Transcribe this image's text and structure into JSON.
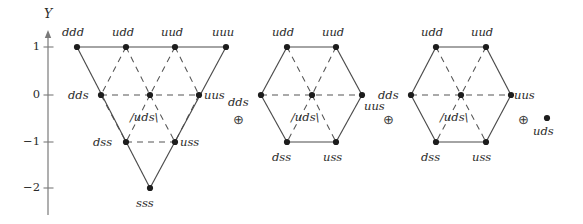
{
  "figure": {
    "axis": {
      "name": "Y",
      "ticks": [
        {
          "label": "1",
          "value": 1,
          "y": 47
        },
        {
          "label": "0",
          "value": 0,
          "y": 95
        },
        {
          "label": "−1",
          "value": -1,
          "y": 142
        },
        {
          "label": "−2",
          "value": -2,
          "y": 188
        }
      ],
      "axis_x": 48,
      "axis_top": 36,
      "axis_bottom": 215
    },
    "operators": [
      {
        "name": "oplus-1",
        "symbol": "⊕",
        "x": 233,
        "y": 113
      },
      {
        "name": "oplus-2",
        "symbol": "⊕",
        "x": 383,
        "y": 113
      },
      {
        "name": "oplus-3",
        "symbol": "⊕",
        "x": 518,
        "y": 113
      }
    ],
    "multiplets": [
      {
        "name": "decuplet",
        "shape": "triangle",
        "nodes": [
          {
            "id": "ddd",
            "label": "ddd",
            "x": 77,
            "y": 47,
            "Y": 1,
            "lx": 62,
            "ly": 27,
            "anchor": "left"
          },
          {
            "id": "udd",
            "label": "udd",
            "x": 126,
            "y": 47,
            "Y": 1,
            "lx": 112,
            "ly": 27,
            "anchor": "left"
          },
          {
            "id": "uud",
            "label": "uud",
            "x": 175,
            "y": 47,
            "Y": 1,
            "lx": 161,
            "ly": 27,
            "anchor": "left"
          },
          {
            "id": "uuu",
            "label": "uuu",
            "x": 226,
            "y": 47,
            "Y": 1,
            "lx": 212,
            "ly": 27,
            "anchor": "left"
          },
          {
            "id": "dds",
            "label": "dds",
            "x": 101,
            "y": 95,
            "Y": 0,
            "lx": 68,
            "ly": 90,
            "anchor": "left"
          },
          {
            "id": "uds",
            "label": "/uds\\",
            "x": 150,
            "y": 95,
            "Y": 0,
            "lx": 130,
            "ly": 112,
            "anchor": "left"
          },
          {
            "id": "uus",
            "label": "uus",
            "x": 199,
            "y": 95,
            "Y": 0,
            "lx": 204,
            "ly": 90,
            "anchor": "left"
          },
          {
            "id": "dss",
            "label": "dss",
            "x": 126,
            "y": 142,
            "Y": -1,
            "lx": 93,
            "ly": 137,
            "anchor": "left"
          },
          {
            "id": "uss",
            "label": "uss",
            "x": 175,
            "y": 142,
            "Y": -1,
            "lx": 180,
            "ly": 137,
            "anchor": "left"
          },
          {
            "id": "sss",
            "label": "sss",
            "x": 150,
            "y": 188,
            "Y": -2,
            "lx": 136,
            "ly": 198,
            "anchor": "left"
          }
        ],
        "solid_edges": [
          [
            77,
            47,
            226,
            47
          ],
          [
            77,
            47,
            150,
            188
          ],
          [
            226,
            47,
            150,
            188
          ]
        ],
        "dashed_edges": [
          [
            101,
            95,
            199,
            95
          ],
          [
            126,
            142,
            175,
            142
          ],
          [
            126,
            47,
            101,
            95
          ],
          [
            126,
            47,
            150,
            95
          ],
          [
            175,
            47,
            150,
            95
          ],
          [
            175,
            47,
            199,
            95
          ],
          [
            101,
            95,
            126,
            142
          ],
          [
            150,
            95,
            126,
            142
          ],
          [
            150,
            95,
            175,
            142
          ],
          [
            199,
            95,
            175,
            142
          ]
        ]
      },
      {
        "name": "octet-1",
        "shape": "hexagon",
        "nodes": [
          {
            "id": "udd",
            "label": "udd",
            "x": 287,
            "y": 47,
            "Y": 1,
            "lx": 272,
            "ly": 27,
            "anchor": "left"
          },
          {
            "id": "uud",
            "label": "uud",
            "x": 336,
            "y": 47,
            "Y": 1,
            "lx": 322,
            "ly": 27,
            "anchor": "left"
          },
          {
            "id": "dds",
            "label": "dds",
            "x": 261,
            "y": 95,
            "Y": 0,
            "lx": 228,
            "ly": 97,
            "anchor": "left"
          },
          {
            "id": "uds",
            "label": "/uds\\",
            "x": 312,
            "y": 95,
            "Y": 0,
            "lx": 291,
            "ly": 112,
            "anchor": "left"
          },
          {
            "id": "uus",
            "label": "uus",
            "x": 362,
            "y": 95,
            "Y": 0,
            "lx": 364,
            "ly": 101,
            "anchor": "left"
          },
          {
            "id": "dss",
            "label": "dss",
            "x": 287,
            "y": 142,
            "Y": -1,
            "lx": 272,
            "ly": 152,
            "anchor": "left"
          },
          {
            "id": "uss",
            "label": "uss",
            "x": 336,
            "y": 142,
            "Y": -1,
            "lx": 323,
            "ly": 152,
            "anchor": "left"
          }
        ],
        "solid_edges": [
          [
            287,
            47,
            336,
            47
          ],
          [
            336,
            47,
            362,
            95
          ],
          [
            362,
            95,
            336,
            142
          ],
          [
            336,
            142,
            287,
            142
          ],
          [
            287,
            142,
            261,
            95
          ],
          [
            261,
            95,
            287,
            47
          ]
        ],
        "dashed_edges": [
          [
            261,
            95,
            362,
            95
          ],
          [
            287,
            47,
            312,
            95
          ],
          [
            336,
            47,
            312,
            95
          ],
          [
            312,
            95,
            287,
            142
          ],
          [
            312,
            95,
            336,
            142
          ]
        ]
      },
      {
        "name": "octet-2",
        "shape": "hexagon",
        "nodes": [
          {
            "id": "udd",
            "label": "udd",
            "x": 436,
            "y": 47,
            "Y": 1,
            "lx": 421,
            "ly": 27,
            "anchor": "left"
          },
          {
            "id": "uud",
            "label": "uud",
            "x": 486,
            "y": 47,
            "Y": 1,
            "lx": 471,
            "ly": 27,
            "anchor": "left"
          },
          {
            "id": "dds",
            "label": "dds",
            "x": 411,
            "y": 95,
            "Y": 0,
            "lx": 378,
            "ly": 90,
            "anchor": "left"
          },
          {
            "id": "uds",
            "label": "/uds\\",
            "x": 461,
            "y": 95,
            "Y": 0,
            "lx": 440,
            "ly": 112,
            "anchor": "left"
          },
          {
            "id": "uus",
            "label": "uus",
            "x": 511,
            "y": 95,
            "Y": 0,
            "lx": 514,
            "ly": 90,
            "anchor": "left"
          },
          {
            "id": "dss",
            "label": "dss",
            "x": 436,
            "y": 142,
            "Y": -1,
            "lx": 421,
            "ly": 152,
            "anchor": "left"
          },
          {
            "id": "uss",
            "label": "uss",
            "x": 486,
            "y": 142,
            "Y": -1,
            "lx": 472,
            "ly": 152,
            "anchor": "left"
          }
        ],
        "solid_edges": [
          [
            436,
            47,
            486,
            47
          ],
          [
            486,
            47,
            511,
            95
          ],
          [
            511,
            95,
            486,
            142
          ],
          [
            486,
            142,
            436,
            142
          ],
          [
            436,
            142,
            411,
            95
          ],
          [
            411,
            95,
            436,
            47
          ]
        ],
        "dashed_edges": [
          [
            411,
            95,
            511,
            95
          ],
          [
            436,
            47,
            461,
            95
          ],
          [
            486,
            47,
            461,
            95
          ],
          [
            461,
            95,
            436,
            142
          ],
          [
            461,
            95,
            486,
            142
          ]
        ]
      },
      {
        "name": "singlet",
        "shape": "point",
        "nodes": [
          {
            "id": "uds",
            "label": "uds",
            "x": 547,
            "y": 118,
            "Y": 0,
            "lx": 533,
            "ly": 126,
            "anchor": "left"
          }
        ],
        "solid_edges": [],
        "dashed_edges": []
      }
    ],
    "colors": {
      "ink": "#2b2b2b",
      "line": "#4a4a4a",
      "dash": "#555555",
      "axis": "#7a7a7a",
      "background": "#ffffff"
    }
  }
}
